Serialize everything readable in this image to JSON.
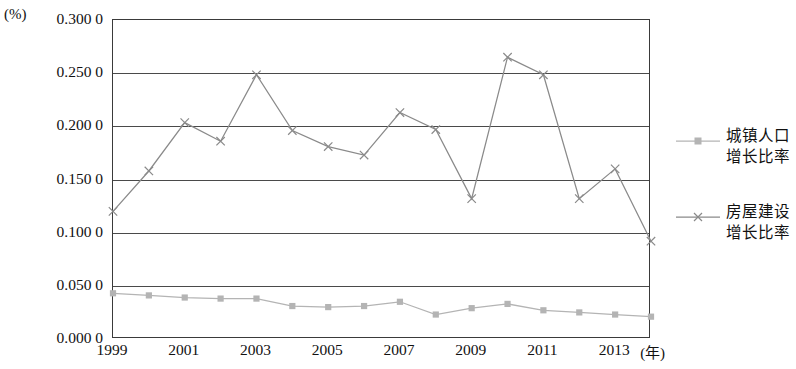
{
  "chart_data": {
    "type": "line",
    "title": "",
    "xlabel": "(年)",
    "ylabel": "(%)",
    "x": [
      1999,
      2000,
      2001,
      2002,
      2003,
      2004,
      2005,
      2006,
      2007,
      2008,
      2009,
      2010,
      2011,
      2012,
      2013,
      2014
    ],
    "x_tick_labels": [
      "1999",
      "2001",
      "2003",
      "2005",
      "2007",
      "2009",
      "2011",
      "2013"
    ],
    "y_tick_labels": [
      "0.300 0",
      "0.250 0",
      "0.200 0",
      "0.150 0",
      "0.100 0",
      "0.050 0",
      "0.000 0"
    ],
    "y_tick_values": [
      0.3,
      0.25,
      0.2,
      0.15,
      0.1,
      0.05,
      0.0
    ],
    "ylim": [
      0.0,
      0.3
    ],
    "xlim": [
      1999,
      2014
    ],
    "grid": true,
    "legend_position": "right",
    "series": [
      {
        "name": "城镇人口增长比率",
        "name_lines": [
          "城镇人口",
          "增长比率"
        ],
        "marker": "square",
        "color": "#b4b4b4",
        "values": [
          0.043,
          0.041,
          0.039,
          0.038,
          0.038,
          0.031,
          0.03,
          0.031,
          0.035,
          0.023,
          0.029,
          0.033,
          0.027,
          0.025,
          0.023,
          0.021
        ]
      },
      {
        "name": "房屋建设增长比率",
        "name_lines": [
          "房屋建设",
          "增长比率"
        ],
        "marker": "x",
        "color": "#8a8a8a",
        "values": [
          0.12,
          0.158,
          0.2035,
          0.186,
          0.2485,
          0.196,
          0.181,
          0.173,
          0.213,
          0.197,
          0.132,
          0.265,
          0.2485,
          0.132,
          0.16,
          0.092
        ]
      }
    ]
  }
}
